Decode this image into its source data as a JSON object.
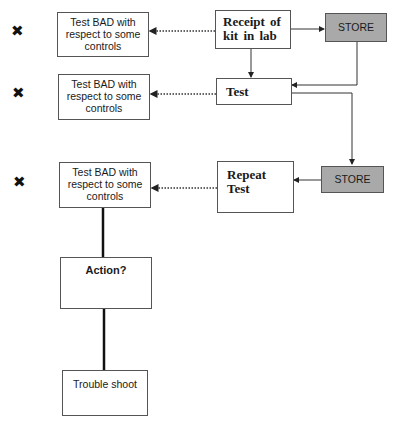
{
  "diagram": {
    "nodes": {
      "receipt": {
        "label": "Receipt   of kit in lab"
      },
      "store_top": {
        "label": "STORE",
        "fill": "#a9a9a9"
      },
      "test": {
        "label": "Test"
      },
      "store_mid": {
        "label": "STORE",
        "fill": "#a9a9a9"
      },
      "repeat_test": {
        "label": "Repeat Test"
      },
      "bad_1": {
        "label": "Test BAD with respect to some controls"
      },
      "bad_2": {
        "label": "Test BAD with respect to some controls"
      },
      "bad_3": {
        "label": "Test BAD with respect to some controls"
      },
      "action": {
        "label": "Action?"
      },
      "trouble_shoot": {
        "label": "Trouble shoot"
      }
    },
    "markers": [
      {
        "symbol": "✖",
        "meaning": "cross-mark"
      },
      {
        "symbol": "✖",
        "meaning": "cross-mark"
      },
      {
        "symbol": "✖",
        "meaning": "cross-mark"
      }
    ],
    "edges": [
      {
        "from": "receipt",
        "to": "store_top",
        "style": "solid-arrow"
      },
      {
        "from": "receipt",
        "to": "test",
        "style": "solid-arrow"
      },
      {
        "from": "store_top",
        "to": "test",
        "style": "solid-arrow"
      },
      {
        "from": "test",
        "to": "store_mid",
        "style": "solid-arrow"
      },
      {
        "from": "store_mid",
        "to": "repeat_test",
        "style": "solid-arrow"
      },
      {
        "from": "receipt",
        "to": "bad_1",
        "style": "dotted-arrow"
      },
      {
        "from": "test",
        "to": "bad_2",
        "style": "dotted-arrow"
      },
      {
        "from": "repeat_test",
        "to": "bad_3",
        "style": "dotted-arrow"
      },
      {
        "from": "bad_3",
        "to": "action",
        "style": "thick-line"
      },
      {
        "from": "action",
        "to": "trouble_shoot",
        "style": "thick-line"
      }
    ]
  }
}
